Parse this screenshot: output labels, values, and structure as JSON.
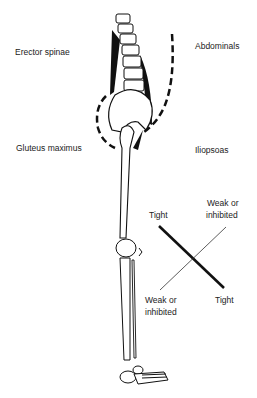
{
  "labels": {
    "erector_spinae": "Erector spinae",
    "abdominals": "Abdominals",
    "gluteus_maximus": "Gluteus maximus",
    "iliopsoas": "Iliopsoas",
    "tight_top": "Tight",
    "weak_top_line1": "Weak or",
    "weak_top_line2": "inhibited",
    "weak_bottom_line1": "Weak or",
    "weak_bottom_line2": "inhibited",
    "tight_bottom": "Tight"
  },
  "colors": {
    "ink": "#111111",
    "background": "#ffffff"
  }
}
